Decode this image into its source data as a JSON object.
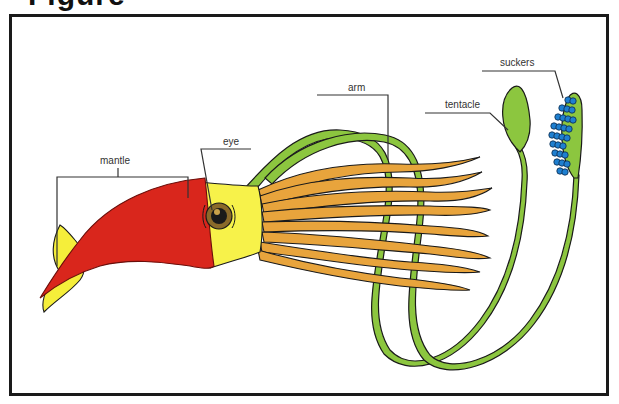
{
  "heading": {
    "text": "Figure",
    "visible_fragment": "g"
  },
  "diagram": {
    "labels": {
      "mantle": "mantle",
      "eye": "eye",
      "arm": "arm",
      "tentacle": "tentacle",
      "suckers": "suckers"
    },
    "colors": {
      "mantle": "#d9261c",
      "fin": "#f5ee3a",
      "head": "#f7f24a",
      "arms": "#e8a43c",
      "tentacles": "#8cc63f",
      "suckers": "#1e7fd0",
      "eye_iris": "#8a6a2a",
      "outline": "#1a1a1a",
      "frame": "#1a1a1a"
    }
  }
}
